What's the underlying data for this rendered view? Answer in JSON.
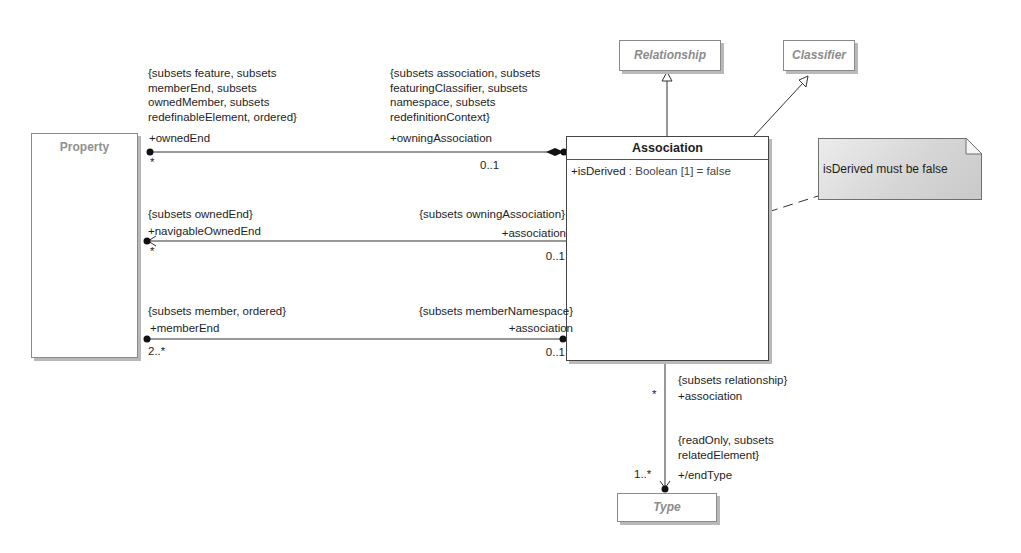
{
  "classes": {
    "property": {
      "name": "Property"
    },
    "association": {
      "name": "Association",
      "attribute": {
        "name": "+isDerived",
        "type": " : Boolean [1] = false"
      }
    },
    "relationship": {
      "name": "Relationship"
    },
    "classifier": {
      "name": "Classifier"
    },
    "type": {
      "name": "Type"
    }
  },
  "note": {
    "text": "isDerived must be false"
  },
  "associations": {
    "owned_end": {
      "left_constraint": "{subsets feature, subsets\nmemberEnd, subsets\nownedMember, subsets\nredefinableElement, ordered}",
      "left_role": "+ownedEnd",
      "left_multiplicity": "*",
      "right_constraint": "{subsets association, subsets\nfeaturingClassifier, subsets\nnamespace, subsets\nredefinitionContext}",
      "right_role": "+owningAssociation",
      "right_multiplicity": "0..1"
    },
    "navigable_owned_end": {
      "left_constraint": "{subsets ownedEnd}",
      "left_role": "+navigableOwnedEnd",
      "left_multiplicity": "*",
      "right_constraint": "{subsets owningAssociation}",
      "right_role": "+association",
      "right_multiplicity": "0..1"
    },
    "member_end": {
      "left_constraint": "{subsets member, ordered}",
      "left_role": "+memberEnd",
      "left_multiplicity": "2..*",
      "right_constraint": "{subsets memberNamespace}",
      "right_role": "+association",
      "right_multiplicity": "0..1"
    },
    "end_type": {
      "top_constraint": "{subsets relationship}",
      "top_role": "+association",
      "top_multiplicity": "*",
      "bottom_constraint": "{readOnly, subsets\nrelatedElement}",
      "bottom_role": "+/endType",
      "bottom_multiplicity": "1..*"
    }
  }
}
